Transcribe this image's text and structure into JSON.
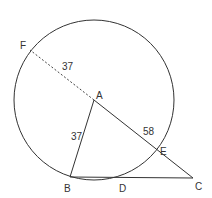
{
  "diagram": {
    "points": {
      "A": {
        "label": "A",
        "x": 94,
        "y": 100
      },
      "B": {
        "label": "B",
        "x": 70,
        "y": 177
      },
      "C": {
        "label": "C",
        "x": 193,
        "y": 178
      },
      "D": {
        "label": "D",
        "x": 120,
        "y": 178
      },
      "E": {
        "label": "E",
        "x": 157,
        "y": 150
      },
      "F": {
        "label": "F",
        "x": 30,
        "y": 50
      }
    },
    "circle": {
      "center": "A",
      "radius": 80
    },
    "segments": [
      {
        "from": "A",
        "to": "F",
        "style": "dashed",
        "length_label": "37"
      },
      {
        "from": "A",
        "to": "B",
        "style": "solid",
        "length_label": "37"
      },
      {
        "from": "A",
        "to": "C",
        "style": "solid",
        "length_label": "58"
      },
      {
        "from": "B",
        "to": "C",
        "style": "solid"
      }
    ],
    "length_labels": {
      "AF": "37",
      "AB": "37",
      "AE": "58"
    },
    "colors": {
      "stroke": "#333333",
      "background": "#ffffff"
    }
  }
}
